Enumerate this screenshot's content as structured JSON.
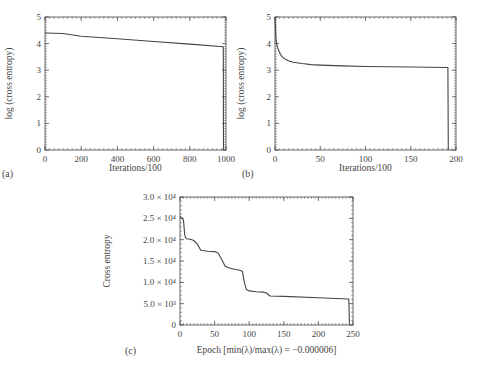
{
  "chart_data": [
    {
      "id": "a",
      "type": "line",
      "panel_label": "(a)",
      "title": "",
      "xlabel": "Iterations/100",
      "ylabel": "log (cross entropy)",
      "xlim": [
        0,
        1000
      ],
      "ylim": [
        0,
        5
      ],
      "xticks": [
        0,
        200,
        400,
        600,
        800,
        1000
      ],
      "yticks": [
        0,
        1,
        2,
        3,
        4,
        5
      ],
      "grid": false,
      "series": [
        {
          "name": "log cross entropy",
          "x": [
            0,
            100,
            200,
            400,
            600,
            800,
            985,
            986
          ],
          "y": [
            4.4,
            4.38,
            4.28,
            4.18,
            4.08,
            3.98,
            3.88,
            0
          ]
        }
      ]
    },
    {
      "id": "b",
      "type": "line",
      "panel_label": "(b)",
      "title": "",
      "xlabel": "Iterations/100",
      "ylabel": "log (cross entropy)",
      "xlim": [
        0,
        200
      ],
      "ylim": [
        0,
        5
      ],
      "xticks": [
        0,
        50,
        100,
        150,
        200
      ],
      "yticks": [
        0,
        1,
        2,
        3,
        4,
        5
      ],
      "grid": false,
      "series": [
        {
          "name": "log cross entropy",
          "x": [
            0,
            0.5,
            1,
            2,
            4,
            6,
            8,
            12,
            16,
            20,
            30,
            40,
            50,
            75,
            100,
            150,
            191,
            191.5
          ],
          "y": [
            5.0,
            4.6,
            4.2,
            3.95,
            3.75,
            3.6,
            3.5,
            3.4,
            3.34,
            3.3,
            3.25,
            3.21,
            3.19,
            3.16,
            3.14,
            3.12,
            3.1,
            0
          ]
        }
      ]
    },
    {
      "id": "c",
      "type": "line",
      "panel_label": "(c)",
      "title": "",
      "xlabel": "Epoch [min(λ)/max(λ) = −0.000006]",
      "ylabel": "Cross entropy",
      "xlim": [
        0,
        250
      ],
      "ylim": [
        0,
        30000
      ],
      "xticks": [
        0,
        50,
        100,
        150,
        200,
        250
      ],
      "yticks": [
        0,
        5000,
        10000,
        15000,
        20000,
        25000,
        30000
      ],
      "ytick_labels": [
        "0",
        "5.0 × 10³",
        "1.0 × 10⁴",
        "1.5 × 10⁴",
        "2.0 × 10⁴",
        "2.5 × 10⁴",
        "3.0 × 10⁴"
      ],
      "grid": false,
      "series": [
        {
          "name": "cross entropy",
          "x": [
            0,
            3,
            5,
            7,
            9,
            15,
            20,
            25,
            30,
            40,
            50,
            55,
            60,
            65,
            70,
            80,
            85,
            90,
            93,
            96,
            100,
            110,
            120,
            125,
            130,
            150,
            200,
            244,
            245
          ],
          "y": [
            25500,
            25000,
            24500,
            21000,
            20200,
            20100,
            19800,
            19000,
            17500,
            17300,
            17200,
            16900,
            15500,
            13800,
            13400,
            13000,
            12900,
            12600,
            10000,
            8300,
            8000,
            7800,
            7700,
            7500,
            6800,
            6700,
            6400,
            6100,
            0
          ]
        }
      ]
    }
  ]
}
